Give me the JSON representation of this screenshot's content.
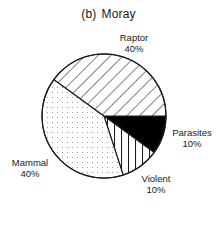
{
  "chart_data": {
    "type": "pie",
    "title_prefix": "(b)",
    "title_name": "Moray",
    "categories": [
      "Parasites",
      "Violent",
      "Mammal",
      "Raptor"
    ],
    "values": [
      10,
      10,
      40,
      40
    ],
    "unit": "%",
    "labels": [
      {
        "name": "Parasites",
        "value": "10%"
      },
      {
        "name": "Violent",
        "value": "10%"
      },
      {
        "name": "Mammal",
        "value": "40%"
      },
      {
        "name": "Raptor",
        "value": "40%"
      }
    ],
    "fills": {
      "Parasites": "solid black",
      "Violent": "vertical lines",
      "Mammal": "dots",
      "Raptor": "diagonal lines"
    },
    "colors": {
      "stroke": "#1a1a1a",
      "solid": "#000000",
      "dots": "#9a9a9a",
      "background": "#ffffff"
    },
    "legend": "none (direct labels)"
  }
}
